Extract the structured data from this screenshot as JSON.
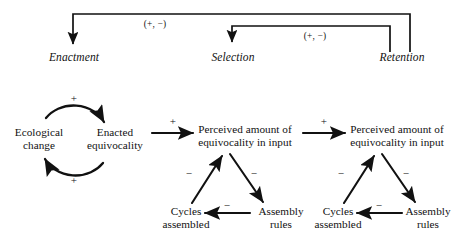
{
  "diagram": {
    "background": "#ffffff",
    "ink": "#111111",
    "top_row": {
      "processes": [
        {
          "id": "enactment",
          "label": "Enactment"
        },
        {
          "id": "selection",
          "label": "Selection"
        },
        {
          "id": "retention",
          "label": "Retention"
        }
      ],
      "feedback_labels": [
        {
          "id": "retention-to-enactment",
          "label": "(+, −)"
        },
        {
          "id": "retention-to-selection",
          "label": "(+, −)"
        }
      ]
    },
    "loop": {
      "nodes": [
        {
          "id": "ecological-change",
          "line1": "Ecological",
          "line2": "change"
        },
        {
          "id": "enacted-equivocality",
          "line1": "Enacted",
          "line2": "equivocality"
        }
      ],
      "signs": [
        {
          "id": "loop-top-sign",
          "label": "+"
        },
        {
          "id": "loop-bottom-sign",
          "label": "+"
        }
      ]
    },
    "links": [
      {
        "id": "enacted-to-perceived-1",
        "label": "+"
      },
      {
        "id": "perceived1-to-perceived-2",
        "label": "+"
      }
    ],
    "cluster_1": {
      "perceived": {
        "id": "perceived-amount-1",
        "line1": "Perceived amount of",
        "line2": "equivocality in input"
      },
      "cycles": {
        "id": "cycles-assembled-1",
        "line1": "Cycles",
        "line2": "assembled"
      },
      "assembly": {
        "id": "assembly-rules-1",
        "line1": "Assembly",
        "line2": "rules"
      },
      "signs": [
        {
          "id": "cycles-to-perceived-1-sign",
          "label": "−"
        },
        {
          "id": "perceived-to-assembly-1-sign",
          "label": "−"
        },
        {
          "id": "assembly-to-cycles-1-sign",
          "label": "−"
        }
      ]
    },
    "cluster_2": {
      "perceived": {
        "id": "perceived-amount-2",
        "line1": "Perceived amount of",
        "line2": "equivocality in input"
      },
      "cycles": {
        "id": "cycles-assembled-2",
        "line1": "Cycles",
        "line2": "assembled"
      },
      "assembly": {
        "id": "assembly-rules-2",
        "line1": "Assembly",
        "line2": "rules"
      },
      "signs": [
        {
          "id": "cycles-to-perceived-2-sign",
          "label": "−"
        },
        {
          "id": "perceived-to-assembly-2-sign",
          "label": "−"
        },
        {
          "id": "assembly-to-cycles-2-sign",
          "label": "−"
        }
      ]
    }
  }
}
